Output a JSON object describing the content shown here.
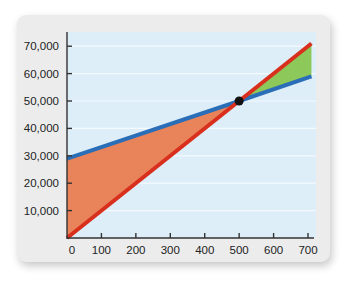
{
  "chart_data": {
    "type": "line",
    "title": "",
    "xlabel": "",
    "ylabel": "",
    "xlim": [
      0,
      710
    ],
    "ylim": [
      0,
      75000
    ],
    "grid": true,
    "legend": "none",
    "x_ticks": [
      0,
      100,
      200,
      300,
      400,
      500,
      600,
      700
    ],
    "x_tick_labels": [
      "0",
      "100",
      "200",
      "300",
      "400",
      "500",
      "600",
      "700"
    ],
    "y_ticks": [
      10000,
      20000,
      30000,
      40000,
      50000,
      60000,
      70000
    ],
    "y_tick_labels": [
      "10,000",
      "20,000",
      "30,000",
      "40,000",
      "50,000",
      "60,000",
      "70,000"
    ],
    "series": [
      {
        "name": "blue-line",
        "color": "#2A6EB8",
        "x": [
          0,
          500,
          710
        ],
        "values": [
          29000,
          50000,
          59000
        ]
      },
      {
        "name": "red-line",
        "color": "#D9301E",
        "x": [
          0,
          500,
          710
        ],
        "values": [
          0,
          50000,
          71000
        ]
      }
    ],
    "intersection": {
      "x": 500,
      "y": 50000,
      "color": "#111111"
    },
    "shaded_regions": [
      {
        "name": "loss-region",
        "between": [
          "blue-line",
          "red-line"
        ],
        "x_range": [
          0,
          500
        ],
        "color": "#E8835A"
      },
      {
        "name": "profit-region",
        "between": [
          "red-line",
          "blue-line"
        ],
        "x_range": [
          500,
          710
        ],
        "color": "#8CC85A"
      }
    ]
  },
  "style": {
    "plot_background": "#DDEEF9",
    "gridline_color": "#F4F9FD",
    "axis_color": "#333333"
  }
}
